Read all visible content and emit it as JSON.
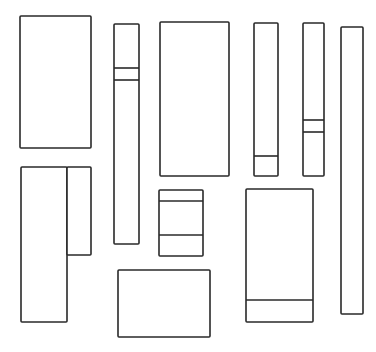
{
  "diagram": {
    "title": "",
    "stroke_color": "#2a2a2a",
    "background_color": "#ffffff",
    "shapes": [
      {
        "id": "rect-1",
        "x": 20,
        "y": 16,
        "w": 71,
        "h": 132,
        "dividers_y": []
      },
      {
        "id": "rect-2",
        "x": 114,
        "y": 24,
        "w": 25,
        "h": 220,
        "dividers_y": [
          68,
          80
        ]
      },
      {
        "id": "rect-3",
        "x": 160,
        "y": 22,
        "w": 69,
        "h": 154,
        "dividers_y": []
      },
      {
        "id": "rect-4",
        "x": 254,
        "y": 23,
        "w": 24,
        "h": 153,
        "dividers_y": [
          156
        ]
      },
      {
        "id": "rect-5",
        "x": 303,
        "y": 23,
        "w": 21,
        "h": 153,
        "dividers_y": [
          120,
          132
        ]
      },
      {
        "id": "rect-6",
        "x": 341,
        "y": 27,
        "w": 22,
        "h": 287,
        "dividers_y": []
      },
      {
        "id": "rect-7a",
        "x": 21,
        "y": 167,
        "w": 46,
        "h": 155,
        "dividers_y": []
      },
      {
        "id": "rect-7b",
        "x": 67,
        "y": 167,
        "w": 24,
        "h": 88,
        "dividers_y": []
      },
      {
        "id": "rect-8",
        "x": 159,
        "y": 190,
        "w": 44,
        "h": 66,
        "dividers_y": [
          201,
          235
        ]
      },
      {
        "id": "rect-9",
        "x": 118,
        "y": 270,
        "w": 92,
        "h": 67,
        "dividers_y": []
      },
      {
        "id": "rect-10",
        "x": 246,
        "y": 189,
        "w": 67,
        "h": 133,
        "dividers_y": [
          300
        ]
      }
    ]
  }
}
